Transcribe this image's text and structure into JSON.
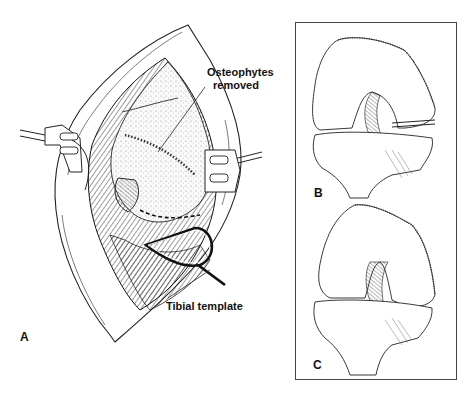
{
  "figure": {
    "panels": [
      {
        "id": "A",
        "letter": "A",
        "description": "Surgical exposure of knee joint with retractors and tibial template in place"
      },
      {
        "id": "B",
        "letter": "B",
        "description": "Anterior view of knee (femur and tibia) with resection line"
      },
      {
        "id": "C",
        "letter": "C",
        "description": "Anterior view of knee after resection"
      }
    ],
    "annotations": {
      "osteophytes_line1": "Osteophytes",
      "osteophytes_line2": "removed",
      "tibial_template": "Tibial template"
    },
    "colors": {
      "ink": "#111111",
      "background": "#ffffff",
      "box_border": "#444444"
    }
  }
}
